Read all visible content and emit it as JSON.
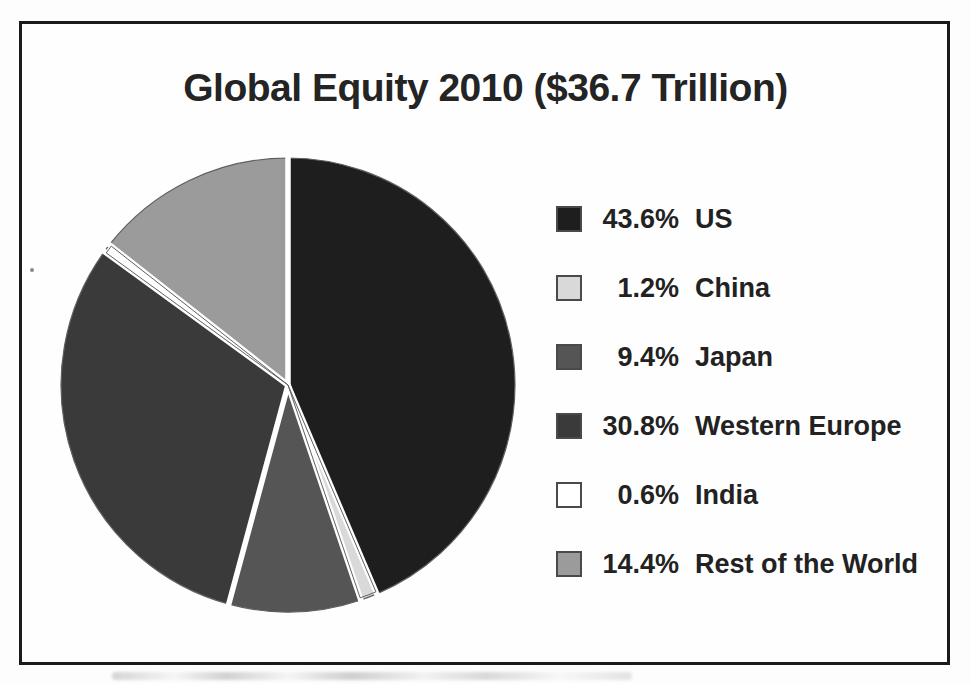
{
  "title": "Global Equity 2010 ($36.7 Trillion)",
  "chart_data": {
    "type": "pie",
    "title": "Global Equity 2010 ($36.7 Trillion)",
    "total": "$36.7 Trillion",
    "unit": "%",
    "start_angle_deg": 0,
    "direction": "clockwise",
    "legend_position": "right",
    "separator_color": "#ffffff",
    "outline_color": "#5f5f5f",
    "slices": [
      {
        "label": "US",
        "value": 43.6,
        "pct_label": "43.6%",
        "color": "#1e1e1e",
        "outlined": false
      },
      {
        "label": "China",
        "value": 1.2,
        "pct_label": "1.2%",
        "color": "#d9d9d9",
        "outlined": true
      },
      {
        "label": "Japan",
        "value": 9.4,
        "pct_label": "9.4%",
        "color": "#555555",
        "outlined": false
      },
      {
        "label": "Western Europe",
        "value": 30.8,
        "pct_label": "30.8%",
        "color": "#3a3a3a",
        "outlined": false
      },
      {
        "label": "India",
        "value": 0.6,
        "pct_label": "0.6%",
        "color": "#ffffff",
        "outlined": true
      },
      {
        "label": "Rest of the World",
        "value": 14.4,
        "pct_label": "14.4%",
        "color": "#9b9b9b",
        "outlined": false
      }
    ]
  }
}
